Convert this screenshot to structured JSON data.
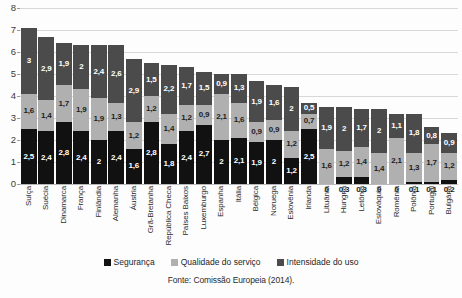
{
  "chart_data": {
    "type": "bar",
    "stacked": true,
    "title": "",
    "subtitle": "",
    "xlabel": "",
    "ylabel": "",
    "ylim": [
      0,
      8
    ],
    "yticks": [
      0,
      1,
      2,
      3,
      4,
      5,
      6,
      7,
      8
    ],
    "ytick_labels": [
      "0",
      "1",
      "2",
      "3",
      "4",
      "5",
      "6",
      "7",
      "8"
    ],
    "grid": true,
    "legend_position": "bottom",
    "categories": [
      "Suíça",
      "Suécia",
      "Dinamarca",
      "França",
      "Finlândia",
      "Alemanha",
      "Áustria",
      "Grã-Bretanha",
      "República Checa",
      "Países Baixos",
      "Luxemburgo",
      "Espanha",
      "Itália",
      "Bélgica",
      "Noruega",
      "Eslovênia",
      "Irlanda",
      "Lituânia",
      "Hungria",
      "Letônia",
      "Eslováquia",
      "Romênia",
      "Polônia",
      "Portugal",
      "Bulgária"
    ],
    "series": [
      {
        "name": "Segurança",
        "color": "#111111",
        "values": [
          2.5,
          2.4,
          2.8,
          2.4,
          2.0,
          2.4,
          1.6,
          2.8,
          1.8,
          2.4,
          2.7,
          2.0,
          2.1,
          1.9,
          2.0,
          1.2,
          2.5,
          0,
          0.3,
          0.3,
          0,
          0,
          0.1,
          0.1,
          0.2
        ],
        "labels": [
          "2,5",
          "2,4",
          "2,8",
          "2,4",
          "2",
          "2,4",
          "1,6",
          "2,8",
          "1,8",
          "2,4",
          "2,7",
          "2",
          "2,1",
          "1,9",
          "2",
          "1,2",
          "2,5",
          "0",
          "0,3",
          "0,3",
          "0",
          "0",
          "0,1",
          "0,1",
          "0,2"
        ]
      },
      {
        "name": "Qualidade do serviço",
        "color": "#b0b0b0",
        "values": [
          1.6,
          1.4,
          1.7,
          1.9,
          1.9,
          1.3,
          1.2,
          1.2,
          1.4,
          1.2,
          0.9,
          2.1,
          1.6,
          0.9,
          0.9,
          1.2,
          0.7,
          1.6,
          1.2,
          1.4,
          1.4,
          2.1,
          1.3,
          1.7,
          1.2
        ],
        "labels": [
          "1,6",
          "1,4",
          "1,7",
          "1,9",
          "1,9",
          "1,3",
          "1,2",
          "1,2",
          "1,4",
          "1,2",
          "0,9",
          "2,1",
          "1,6",
          "0,9",
          "0,9",
          "1,2",
          "0,7",
          "1,6",
          "1,2",
          "1,4",
          "1,4",
          "2,1",
          "1,3",
          "1,7",
          "1,2"
        ]
      },
      {
        "name": "Intensidade do uso",
        "color": "#4b4b4b",
        "values": [
          3.0,
          2.9,
          1.9,
          2.0,
          2.4,
          2.6,
          2.9,
          1.5,
          2.2,
          1.7,
          1.5,
          0.9,
          1.3,
          1.9,
          1.6,
          2.0,
          0.5,
          1.9,
          2.0,
          1.7,
          2.0,
          1.1,
          1.8,
          0.8,
          0.9
        ],
        "labels": [
          "3",
          "2,9",
          "1,9",
          "2",
          "2,4",
          "2,6",
          "2,9",
          "1,5",
          "2,2",
          "1,7",
          "1,5",
          "0,9",
          "1,3",
          "1,9",
          "1,6",
          "2",
          "0,5",
          "1,9",
          "2",
          "1,7",
          "2",
          "1,1",
          "1,8",
          "0,8",
          "0,9"
        ]
      }
    ],
    "totals": [
      7.1,
      6.7,
      6.4,
      6.3,
      6.3,
      6.3,
      5.7,
      5.5,
      5.4,
      5.3,
      5.1,
      5.0,
      5.0,
      4.7,
      4.5,
      4.4,
      3.7,
      3.5,
      3.5,
      3.4,
      3.4,
      3.2,
      3.2,
      2.6,
      2.3
    ]
  },
  "legend": {
    "items": [
      {
        "label": "Segurança",
        "color": "#111111",
        "swatch_name": "legend-swatch-seguranca"
      },
      {
        "label": "Qualidade do serviço",
        "color": "#b0b0b0",
        "swatch_name": "legend-swatch-qualidade"
      },
      {
        "label": "Intensidade do uso",
        "color": "#4b4b4b",
        "swatch_name": "legend-swatch-intensidade"
      }
    ]
  },
  "source_note": "Fonte: Comissão Europeia (2014)."
}
